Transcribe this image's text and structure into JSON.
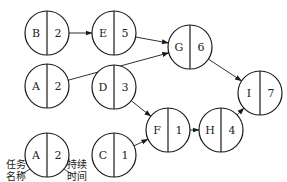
{
  "diagram": {
    "type": "activity-on-node network",
    "nodes": [
      {
        "id": "B",
        "name": "B",
        "duration": "2",
        "cx": 47,
        "cy": 33
      },
      {
        "id": "E",
        "name": "E",
        "duration": "5",
        "cx": 114,
        "cy": 33
      },
      {
        "id": "G",
        "name": "G",
        "duration": "6",
        "cx": 190,
        "cy": 47
      },
      {
        "id": "A",
        "name": "A",
        "duration": "2",
        "cx": 47,
        "cy": 86
      },
      {
        "id": "D",
        "name": "D",
        "duration": "3",
        "cx": 114,
        "cy": 87
      },
      {
        "id": "F",
        "name": "F",
        "duration": "1",
        "cx": 168,
        "cy": 130
      },
      {
        "id": "H",
        "name": "H",
        "duration": "4",
        "cx": 221,
        "cy": 130
      },
      {
        "id": "I",
        "name": "I",
        "duration": "7",
        "cx": 260,
        "cy": 93
      },
      {
        "id": "C",
        "name": "C",
        "duration": "1",
        "cx": 114,
        "cy": 155
      }
    ],
    "edges": [
      {
        "from": "B",
        "to": "E"
      },
      {
        "from": "E",
        "to": "G"
      },
      {
        "from": "A",
        "to": "G"
      },
      {
        "from": "G",
        "to": "I"
      },
      {
        "from": "D",
        "to": "F"
      },
      {
        "from": "C",
        "to": "F"
      },
      {
        "from": "F",
        "to": "H"
      },
      {
        "from": "H",
        "to": "I"
      }
    ],
    "legend": {
      "example_name": "A",
      "example_duration": "2",
      "name_label_line1": "任务",
      "name_label_line2": "名称",
      "duration_label_line1": "持续",
      "duration_label_line2": "时间"
    }
  }
}
